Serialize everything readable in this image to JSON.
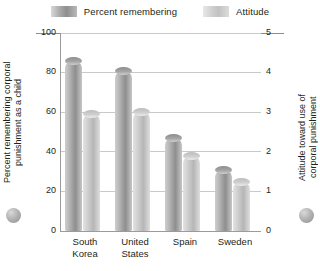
{
  "legend": {
    "items": [
      {
        "label": "Percent remembering",
        "key": "percent",
        "color": "#9c9c9c"
      },
      {
        "label": "Attitude",
        "key": "attitude",
        "color": "#c6c6c6"
      }
    ]
  },
  "axes": {
    "left": {
      "title": "Percent remembering corporal\npunishment as a child",
      "ticks": [
        "100",
        "80",
        "60",
        "40",
        "20",
        "0"
      ],
      "min": 0,
      "max": 100
    },
    "right": {
      "title": "Attitude toward use of\ncorporal punishment",
      "ticks": [
        "5",
        "4",
        "3",
        "2",
        "1",
        "0"
      ],
      "min": 0,
      "max": 5
    }
  },
  "chart_data": {
    "type": "bar",
    "title": "",
    "xlabel": "",
    "ylabel": "Percent remembering corporal punishment as a child",
    "y2label": "Attitude toward use of corporal punishment",
    "categories": [
      "South Korea",
      "United States",
      "Spain",
      "Sweden"
    ],
    "category_lines": [
      [
        "South",
        "Korea"
      ],
      [
        "United",
        "States"
      ],
      [
        "Spain"
      ],
      [
        "Sweden"
      ]
    ],
    "ylim": [
      0,
      100
    ],
    "y2lim": [
      0,
      5
    ],
    "yticks": [
      0,
      20,
      40,
      60,
      80,
      100
    ],
    "y2ticks": [
      0,
      1,
      2,
      3,
      4,
      5
    ],
    "grid": true,
    "legend_position": "top",
    "series": [
      {
        "name": "Percent remembering",
        "axis": "left",
        "values": [
          86,
          81,
          47,
          31
        ],
        "color": "#9c9c9c"
      },
      {
        "name": "Attitude",
        "axis": "right",
        "values": [
          2.95,
          3.0,
          1.9,
          1.25
        ],
        "values_scaled": [
          59,
          60,
          38,
          25
        ],
        "color": "#c6c6c6"
      }
    ]
  }
}
